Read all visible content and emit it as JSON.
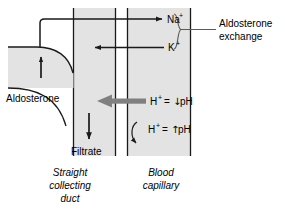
{
  "figure": {
    "colors": {
      "band_fill": "#e3e3e3",
      "line": "#1a1a1a",
      "gray_arrow": "#808080",
      "background": "#ffffff"
    }
  },
  "ions": {
    "sodium": "Na",
    "sodium_charge": "+",
    "potassium": "K",
    "potassium_charge": "+"
  },
  "callout": {
    "line1": "Aldosterone",
    "line2": "exchange"
  },
  "left_label": {
    "aldosterone": "Aldosterone"
  },
  "ph_rows": {
    "row1": {
      "ion": "H",
      "charge": "+",
      "equals": "=",
      "arrow": "↓",
      "unit": "pH"
    },
    "row2": {
      "ion": "H",
      "charge": "+",
      "equals": "=",
      "arrow": "↑",
      "unit": "pH"
    }
  },
  "filtrate": {
    "label": "Filtrate"
  },
  "compartments": {
    "duct": {
      "line1": "Straight",
      "line2": "collecting",
      "line3": "duct"
    },
    "capillary": {
      "line1": "Blood",
      "line2": "capillary"
    }
  },
  "icons": {
    "na_arrow": "arrow-right-icon",
    "k_arrow": "arrow-left-icon",
    "h_gray_arrow": "thick-arrow-left-icon",
    "h_curved_arrow": "curved-arrow-down-right-icon",
    "filtrate_arrow": "arrow-down-icon",
    "aldosterone_arrow": "arrow-up-icon",
    "brace": "right-curly-brace-icon"
  }
}
